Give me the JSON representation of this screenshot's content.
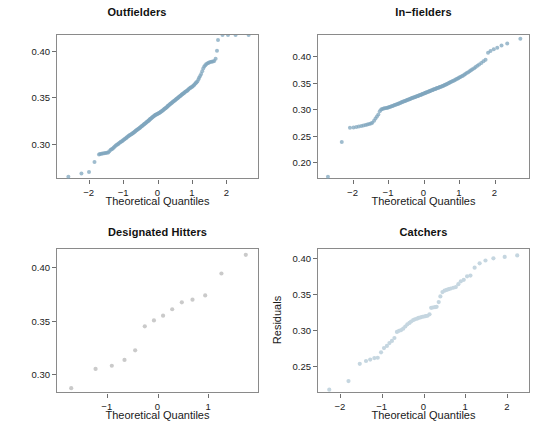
{
  "figure": {
    "width": 547,
    "height": 439,
    "background": "#ffffff",
    "shared_axis_title": "Theoretical Quantiles",
    "shared_y_title": "Residuals",
    "point_color_dense": "#6b93ad",
    "point_color_light": "#c5d6e0",
    "point_color_grey": "#c9c9c9",
    "axis_color": "#8a8a8a"
  },
  "chart_data": [
    {
      "type": "scatter",
      "title": "Outfielders",
      "xlabel": "Theoretical Quantiles",
      "ylabel": "",
      "xlim": [
        -2.95,
        2.95
      ],
      "ylim": [
        0.262,
        0.418
      ],
      "grid": false,
      "legend": "none",
      "xticks": [
        -2,
        -1,
        0,
        1,
        2
      ],
      "xticklabels": [
        "−2",
        "−1",
        "0",
        "1",
        "2"
      ],
      "yticks": [
        0.3,
        0.35,
        0.4
      ],
      "yticklabels": [
        "0.30",
        "0.35",
        "0.40"
      ],
      "marker_color": "#7fa6bd",
      "x": [
        -2.62,
        -2.24,
        -2.02,
        -1.86,
        -1.73,
        -1.7,
        -1.66,
        -1.62,
        -1.58,
        -1.54,
        -1.5,
        -1.46,
        -1.43,
        -1.39,
        -1.36,
        -1.33,
        -1.3,
        -1.27,
        -1.24,
        -1.21,
        -1.18,
        -1.16,
        -1.13,
        -1.1,
        -1.08,
        -1.05,
        -1.03,
        -1.0,
        -0.98,
        -0.95,
        -0.93,
        -0.91,
        -0.88,
        -0.86,
        -0.84,
        -0.82,
        -0.79,
        -0.77,
        -0.75,
        -0.73,
        -0.71,
        -0.69,
        -0.67,
        -0.65,
        -0.63,
        -0.61,
        -0.59,
        -0.57,
        -0.55,
        -0.53,
        -0.51,
        -0.49,
        -0.47,
        -0.45,
        -0.43,
        -0.41,
        -0.39,
        -0.37,
        -0.35,
        -0.33,
        -0.31,
        -0.29,
        -0.27,
        -0.26,
        -0.24,
        -0.22,
        -0.2,
        -0.18,
        -0.16,
        -0.14,
        -0.12,
        -0.1,
        -0.08,
        -0.06,
        -0.04,
        -0.02,
        0.0,
        0.02,
        0.04,
        0.06,
        0.08,
        0.1,
        0.12,
        0.14,
        0.16,
        0.18,
        0.2,
        0.22,
        0.24,
        0.26,
        0.27,
        0.29,
        0.31,
        0.33,
        0.35,
        0.37,
        0.39,
        0.41,
        0.43,
        0.45,
        0.47,
        0.49,
        0.51,
        0.53,
        0.55,
        0.57,
        0.59,
        0.61,
        0.63,
        0.65,
        0.67,
        0.69,
        0.71,
        0.73,
        0.75,
        0.77,
        0.79,
        0.82,
        0.84,
        0.86,
        0.88,
        0.91,
        0.93,
        0.95,
        0.98,
        1.0,
        1.03,
        1.05,
        1.08,
        1.1,
        1.13,
        1.16,
        1.18,
        1.21,
        1.24,
        1.27,
        1.3,
        1.33,
        1.36,
        1.39,
        1.43,
        1.46,
        1.5,
        1.54,
        1.58,
        1.62,
        1.66,
        1.7,
        1.73,
        1.86,
        2.02,
        2.24,
        2.62
      ],
      "y": [
        0.2655,
        0.269,
        0.2705,
        0.2815,
        0.2895,
        0.29,
        0.2902,
        0.2905,
        0.2908,
        0.291,
        0.2912,
        0.2915,
        0.293,
        0.2945,
        0.2952,
        0.296,
        0.297,
        0.298,
        0.299,
        0.2998,
        0.3005,
        0.3012,
        0.302,
        0.3028,
        0.3035,
        0.304,
        0.3048,
        0.3055,
        0.306,
        0.3068,
        0.3075,
        0.3082,
        0.309,
        0.3095,
        0.3102,
        0.3108,
        0.3112,
        0.3118,
        0.3122,
        0.3128,
        0.3135,
        0.314,
        0.3146,
        0.3152,
        0.3158,
        0.3162,
        0.3168,
        0.3175,
        0.318,
        0.3186,
        0.3192,
        0.3198,
        0.3204,
        0.321,
        0.3216,
        0.3222,
        0.3228,
        0.3234,
        0.324,
        0.3246,
        0.3252,
        0.3258,
        0.3264,
        0.327,
        0.3276,
        0.3282,
        0.3288,
        0.3294,
        0.33,
        0.3306,
        0.3312,
        0.3318,
        0.3322,
        0.3326,
        0.333,
        0.3334,
        0.3338,
        0.3342,
        0.3346,
        0.3352,
        0.3358,
        0.3362,
        0.3368,
        0.3374,
        0.338,
        0.3386,
        0.3392,
        0.3398,
        0.3404,
        0.341,
        0.3416,
        0.3422,
        0.3428,
        0.3434,
        0.344,
        0.3446,
        0.3452,
        0.3458,
        0.3464,
        0.347,
        0.3476,
        0.3482,
        0.3488,
        0.3494,
        0.35,
        0.3506,
        0.3512,
        0.3518,
        0.3524,
        0.353,
        0.3536,
        0.3542,
        0.3548,
        0.3554,
        0.356,
        0.3566,
        0.3572,
        0.3578,
        0.3584,
        0.359,
        0.3598,
        0.3606,
        0.3612,
        0.3618,
        0.3624,
        0.363,
        0.364,
        0.365,
        0.3662,
        0.3672,
        0.368,
        0.37,
        0.372,
        0.374,
        0.376,
        0.379,
        0.382,
        0.384,
        0.3855,
        0.3868,
        0.3875,
        0.3882,
        0.389,
        0.3892,
        0.3895,
        0.39,
        0.3925,
        0.401,
        0.4125
      ]
    },
    {
      "type": "scatter",
      "title": "In−fielders",
      "xlabel": "Theoretical Quantiles",
      "ylabel": "",
      "xlim": [
        -3.0,
        3.0
      ],
      "ylim": [
        0.168,
        0.442
      ],
      "grid": false,
      "legend": "none",
      "xticks": [
        -2,
        -1,
        0,
        1,
        2
      ],
      "xticklabels": [
        "−2",
        "−1",
        "0",
        "1",
        "2"
      ],
      "yticks": [
        0.2,
        0.25,
        0.3,
        0.35,
        0.4
      ],
      "yticklabels": [
        "0.20",
        "0.25",
        "0.30",
        "0.35",
        "0.40"
      ],
      "marker_color": "#7fa6bd",
      "x": [
        -2.72,
        -2.33,
        -2.1,
        -2.0,
        -1.92,
        -1.85,
        -1.78,
        -1.72,
        -1.66,
        -1.61,
        -1.56,
        -1.51,
        -1.47,
        -1.42,
        -1.38,
        -1.34,
        -1.3,
        -1.26,
        -1.22,
        -1.19,
        -1.15,
        -1.12,
        -1.08,
        -1.05,
        -1.02,
        -0.99,
        -0.96,
        -0.93,
        -0.9,
        -0.87,
        -0.84,
        -0.81,
        -0.78,
        -0.75,
        -0.73,
        -0.7,
        -0.67,
        -0.65,
        -0.62,
        -0.6,
        -0.57,
        -0.55,
        -0.52,
        -0.5,
        -0.47,
        -0.45,
        -0.42,
        -0.4,
        -0.38,
        -0.35,
        -0.33,
        -0.31,
        -0.28,
        -0.26,
        -0.24,
        -0.21,
        -0.19,
        -0.17,
        -0.15,
        -0.12,
        -0.1,
        -0.08,
        -0.06,
        -0.04,
        -0.01,
        0.01,
        0.03,
        0.05,
        0.07,
        0.1,
        0.12,
        0.14,
        0.16,
        0.18,
        0.21,
        0.23,
        0.25,
        0.27,
        0.3,
        0.32,
        0.34,
        0.36,
        0.39,
        0.41,
        0.43,
        0.46,
        0.48,
        0.51,
        0.53,
        0.56,
        0.58,
        0.61,
        0.63,
        0.66,
        0.69,
        0.71,
        0.74,
        0.77,
        0.8,
        0.83,
        0.86,
        0.89,
        0.92,
        0.95,
        0.98,
        1.01,
        1.05,
        1.08,
        1.12,
        1.15,
        1.19,
        1.23,
        1.27,
        1.31,
        1.35,
        1.4,
        1.44,
        1.49,
        1.54,
        1.6,
        1.66,
        1.72,
        1.79,
        1.86,
        1.95,
        2.05,
        2.17,
        2.33,
        2.7
      ],
      "y": [
        0.174,
        0.24,
        0.2665,
        0.267,
        0.268,
        0.269,
        0.27,
        0.271,
        0.272,
        0.273,
        0.274,
        0.275,
        0.2762,
        0.28,
        0.284,
        0.288,
        0.292,
        0.298,
        0.301,
        0.302,
        0.303,
        0.3035,
        0.304,
        0.3045,
        0.305,
        0.3058,
        0.3065,
        0.3072,
        0.308,
        0.3088,
        0.3095,
        0.3102,
        0.311,
        0.3118,
        0.3125,
        0.3132,
        0.314,
        0.3148,
        0.3155,
        0.3162,
        0.3168,
        0.3175,
        0.3182,
        0.3188,
        0.3195,
        0.3202,
        0.3208,
        0.3215,
        0.3222,
        0.3228,
        0.3235,
        0.324,
        0.3245,
        0.325,
        0.3256,
        0.3262,
        0.3268,
        0.3274,
        0.328,
        0.3286,
        0.3292,
        0.3298,
        0.3304,
        0.331,
        0.3316,
        0.3322,
        0.3328,
        0.3334,
        0.334,
        0.3346,
        0.3352,
        0.3358,
        0.3364,
        0.337,
        0.3376,
        0.3382,
        0.3388,
        0.3394,
        0.34,
        0.3406,
        0.3412,
        0.3418,
        0.3424,
        0.343,
        0.3436,
        0.3442,
        0.3448,
        0.3454,
        0.3462,
        0.347,
        0.3478,
        0.3486,
        0.3494,
        0.3502,
        0.3512,
        0.3522,
        0.3532,
        0.3542,
        0.3552,
        0.3562,
        0.3572,
        0.3582,
        0.3592,
        0.3604,
        0.3616,
        0.3628,
        0.364,
        0.3652,
        0.3668,
        0.3684,
        0.37,
        0.3716,
        0.3734,
        0.3752,
        0.3772,
        0.3792,
        0.3814,
        0.3838,
        0.3862,
        0.389,
        0.3925,
        0.395,
        0.4085,
        0.412,
        0.415,
        0.418,
        0.422,
        0.426,
        0.435
      ]
    },
    {
      "type": "scatter",
      "title": "Designated Hitters",
      "xlabel": "Theoretical Quantiles",
      "ylabel": "",
      "xlim": [
        -2.0,
        2.0
      ],
      "ylim": [
        0.282,
        0.418
      ],
      "grid": false,
      "legend": "none",
      "xticks": [
        -1,
        0,
        1
      ],
      "xticklabels": [
        "−1",
        "0",
        "1"
      ],
      "yticks": [
        0.3,
        0.35,
        0.4
      ],
      "yticklabels": [
        "0.30",
        "0.35",
        "0.40"
      ],
      "marker_color": "#cacaca",
      "x": [
        -1.72,
        -1.24,
        -0.92,
        -0.67,
        -0.46,
        -0.27,
        -0.09,
        0.09,
        0.27,
        0.46,
        0.67,
        0.92,
        1.24,
        1.72
      ],
      "y": [
        0.2875,
        0.3055,
        0.3085,
        0.314,
        0.323,
        0.3455,
        0.351,
        0.3555,
        0.3615,
        0.368,
        0.3705,
        0.3745,
        0.395,
        0.4125
      ]
    },
    {
      "type": "scatter",
      "title": "Catchers",
      "xlabel": "Theoretical Quantiles",
      "ylabel": "Residuals",
      "xlim": [
        -2.55,
        2.55
      ],
      "ylim": [
        0.212,
        0.414
      ],
      "grid": false,
      "legend": "none",
      "xticks": [
        -2,
        -1,
        0,
        1,
        2
      ],
      "xticklabels": [
        "−2",
        "−1",
        "0",
        "1",
        "2"
      ],
      "yticks": [
        0.25,
        0.3,
        0.35,
        0.4
      ],
      "yticklabels": [
        "0.25",
        "0.30",
        "0.35",
        "0.40"
      ],
      "marker_color": "#c5d6e0",
      "x": [
        -2.28,
        -1.82,
        -1.55,
        -1.4,
        -1.3,
        -1.2,
        -1.12,
        -1.04,
        -0.97,
        -0.9,
        -0.84,
        -0.78,
        -0.72,
        -0.66,
        -0.61,
        -0.56,
        -0.51,
        -0.46,
        -0.41,
        -0.36,
        -0.32,
        -0.27,
        -0.23,
        -0.18,
        -0.14,
        -0.09,
        -0.05,
        -0.01,
        0.03,
        0.07,
        0.12,
        0.16,
        0.2,
        0.25,
        0.29,
        0.34,
        0.38,
        0.43,
        0.48,
        0.53,
        0.58,
        0.63,
        0.69,
        0.75,
        0.81,
        0.87,
        0.94,
        1.02,
        1.1,
        1.2,
        1.32,
        1.46,
        1.65,
        1.92,
        2.22
      ],
      "y": [
        0.218,
        0.23,
        0.254,
        0.258,
        0.26,
        0.262,
        0.2625,
        0.27,
        0.276,
        0.279,
        0.283,
        0.286,
        0.29,
        0.2985,
        0.3,
        0.301,
        0.303,
        0.306,
        0.309,
        0.311,
        0.313,
        0.315,
        0.316,
        0.317,
        0.318,
        0.3188,
        0.3196,
        0.32,
        0.3205,
        0.321,
        0.323,
        0.332,
        0.3325,
        0.333,
        0.3335,
        0.34,
        0.348,
        0.354,
        0.356,
        0.357,
        0.358,
        0.359,
        0.36,
        0.361,
        0.365,
        0.369,
        0.371,
        0.376,
        0.377,
        0.388,
        0.394,
        0.398,
        0.401,
        0.403,
        0.405
      ]
    }
  ]
}
